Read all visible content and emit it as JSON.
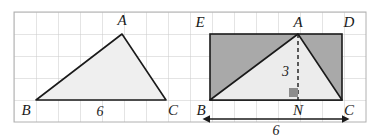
{
  "figure": {
    "grid": {
      "cell_size": 22,
      "line_color": "#c9c9c9",
      "border_color": "#b0b0b0",
      "background": "#ffffff",
      "x_start": 14,
      "y_start": 12,
      "columns": 16,
      "rows": 5
    },
    "colors": {
      "stroke": "#1a1a1a",
      "triangle_fill_left": "#efefef",
      "triangle_fill_right": "#ececec",
      "rectangle_fill": "#a9a9a9",
      "right_angle_marker": "#8c8c8c",
      "label_color": "#1a1a1a"
    },
    "left_diagram": {
      "name": "triangle-abc",
      "vertices": {
        "A": {
          "x": 122,
          "y": 34,
          "label": "A",
          "label_x": 122,
          "label_y": 25
        },
        "B": {
          "x": 36,
          "y": 100,
          "label": "B",
          "label_x": 26,
          "label_y": 115
        },
        "C": {
          "x": 166,
          "y": 100,
          "label": "C",
          "label_x": 172,
          "label_y": 115
        }
      },
      "base_measure": {
        "text": "6",
        "x": 100,
        "y": 115
      }
    },
    "right_diagram": {
      "name": "triangle-abc-in-rectangle-ebcd",
      "rectangle": {
        "left": 210,
        "top": 34,
        "right": 342,
        "bottom": 100
      },
      "vertices": {
        "E": {
          "x": 210,
          "y": 34,
          "label": "E",
          "label_x": 200,
          "label_y": 26
        },
        "A": {
          "x": 298,
          "y": 34,
          "label": "A",
          "label_x": 298,
          "label_y": 26
        },
        "D": {
          "x": 342,
          "y": 34,
          "label": "D",
          "label_x": 348,
          "label_y": 26
        },
        "B": {
          "x": 210,
          "y": 100,
          "label": "B",
          "label_x": 201,
          "label_y": 115
        },
        "N": {
          "x": 298,
          "y": 100,
          "label": "N",
          "label_x": 298,
          "label_y": 115
        },
        "C": {
          "x": 342,
          "y": 100,
          "label": "C",
          "label_x": 348,
          "label_y": 115
        }
      },
      "altitude": {
        "label": "3",
        "label_x": 289,
        "label_y": 72,
        "dash_from_y": 34,
        "dash_to_y": 100,
        "x": 298
      },
      "right_angle_marker": {
        "x": 289,
        "y": 87,
        "size": 9
      },
      "base_measure": {
        "text": "6",
        "x": 276,
        "y": 133,
        "arrow_y": 115,
        "arrow_from_x": 210,
        "arrow_to_x": 342
      }
    }
  }
}
